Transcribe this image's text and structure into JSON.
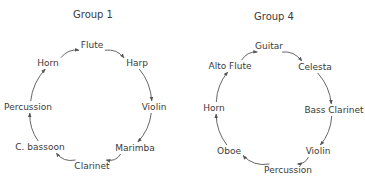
{
  "groups": [
    {
      "title": "Group 1",
      "title_pos": [
        93,
        15
      ],
      "nodes": [
        {
          "label": "Flute",
          "x": 92,
          "y": 45
        },
        {
          "label": "Harp",
          "x": 137,
          "y": 63
        },
        {
          "label": "Violin",
          "x": 154,
          "y": 107
        },
        {
          "label": "Marimba",
          "x": 135,
          "y": 148
        },
        {
          "label": "Clarinet",
          "x": 92,
          "y": 166
        },
        {
          "label": "C. bassoon",
          "x": 40,
          "y": 147
        },
        {
          "label": "Percussion",
          "x": 28,
          "y": 107
        },
        {
          "label": "Horn",
          "x": 48,
          "y": 63
        }
      ],
      "direction": "clockwise"
    },
    {
      "title": "Group 4",
      "title_pos": [
        274,
        17
      ],
      "nodes": [
        {
          "label": "Guitar",
          "x": 269,
          "y": 46
        },
        {
          "label": "Celesta",
          "x": 315,
          "y": 67
        },
        {
          "label": "Bass Clarinet",
          "x": 334,
          "y": 110
        },
        {
          "label": "Violin",
          "x": 318,
          "y": 151
        },
        {
          "label": "Percussion",
          "x": 288,
          "y": 170
        },
        {
          "label": "Oboe",
          "x": 229,
          "y": 151
        },
        {
          "label": "Horn",
          "x": 214,
          "y": 108
        },
        {
          "label": "Alto Flute",
          "x": 230,
          "y": 66
        }
      ],
      "direction": "clockwise"
    }
  ],
  "colors": {
    "stroke": "#555555",
    "text": "#3a3a3a",
    "background": "#ffffff"
  }
}
